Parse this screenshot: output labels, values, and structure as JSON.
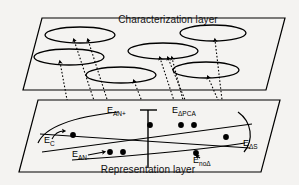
{
  "figure": {
    "name": "two-layer-mapping-diagram",
    "background_color": "#f4f3f1",
    "ink_color": "#000000"
  },
  "layers": {
    "top": {
      "title": "Characterization layer",
      "title_x": 168,
      "title_y": 23,
      "panel_points": "42,18 285,18 266,90 23,90",
      "clusters": [
        {
          "name": "cluster-1",
          "cx": 80,
          "cy": 35,
          "rx": 35,
          "ry": 8
        },
        {
          "name": "cluster-2",
          "cx": 69,
          "cy": 57,
          "rx": 35,
          "ry": 8
        },
        {
          "name": "cluster-3",
          "cx": 121,
          "cy": 75,
          "rx": 35,
          "ry": 8
        },
        {
          "name": "cluster-4",
          "cx": 163,
          "cy": 51,
          "rx": 35,
          "ry": 8
        },
        {
          "name": "cluster-5",
          "cx": 213,
          "cy": 33,
          "rx": 33,
          "ry": 8
        },
        {
          "name": "cluster-6",
          "cx": 206,
          "cy": 70,
          "rx": 33,
          "ry": 8
        }
      ]
    },
    "bottom": {
      "title": "Representation layer",
      "title_x": 148,
      "title_y": 173,
      "panel_points": "38,100 280,100 261,172 19,172"
    }
  },
  "chart_data": {
    "type": "scatter",
    "title": "Representation layer",
    "xlabel": "",
    "ylabel": "",
    "grid": false,
    "legend": "none",
    "axis": {
      "vertical_line": {
        "x": 148,
        "y_top": 110,
        "y_bottom": 168
      },
      "cap_bar": {
        "x1": 140,
        "x2": 157,
        "y": 110
      }
    },
    "point_labels": [
      {
        "id": "EC",
        "base": "E",
        "sub": "C",
        "x": 44,
        "y": 143
      },
      {
        "id": "EANp",
        "base": "E",
        "sub": "AN+",
        "x": 107,
        "y": 113
      },
      {
        "id": "EANm",
        "base": "E",
        "sub": "AN-",
        "x": 72,
        "y": 157
      },
      {
        "id": "EdPCA",
        "base": "E",
        "sub": "ΔPCA",
        "x": 172,
        "y": 113
      },
      {
        "id": "EnoD",
        "base": "E",
        "sub": "noΔ",
        "x": 193,
        "y": 163
      },
      {
        "id": "EdS",
        "base": "E",
        "sub": "ΔS",
        "x": 243,
        "y": 146
      }
    ],
    "points": [
      {
        "name": "point-EC",
        "x": 73,
        "y": 135,
        "r": 2.9,
        "group": "EC"
      },
      {
        "name": "point-EAN-minus-1",
        "x": 110,
        "y": 152,
        "r": 2.9,
        "group": "EAN-"
      },
      {
        "name": "point-EAN-minus-2",
        "x": 123,
        "y": 152,
        "r": 2.9,
        "group": "EAN-"
      },
      {
        "name": "point-EAN-plus",
        "x": 150,
        "y": 125,
        "r": 2.9,
        "group": "EAN+"
      },
      {
        "name": "point-EdPCA-1",
        "x": 181,
        "y": 125,
        "r": 2.9,
        "group": "EdPCA"
      },
      {
        "name": "point-EdPCA-2",
        "x": 194,
        "y": 125,
        "r": 2.9,
        "group": "EdPCA"
      },
      {
        "name": "point-EnoD",
        "x": 196,
        "y": 153,
        "r": 2.9,
        "group": "EnoD"
      },
      {
        "name": "point-EdS",
        "x": 226,
        "y": 137,
        "r": 2.9,
        "group": "EdS"
      }
    ],
    "cross_curves": [
      {
        "name": "curve-upper-sweep",
        "d": "M 38,143 C 45,127 72,117 118,112"
      },
      {
        "name": "curve-lower-sweep",
        "d": "M 72,160 C 120,157 200,150 245,143"
      },
      {
        "name": "curve-diag-down",
        "d": "M 40,134 L 250,148"
      },
      {
        "name": "curve-diag-up",
        "d": "M 42,152 L 252,124"
      },
      {
        "name": "curve-right-arc",
        "d": "M 238,112 C 252,122 254,140 244,152"
      }
    ],
    "leaders": [
      {
        "name": "leader-EC",
        "d": "M 52,139 C 55,133 60,131 64,131"
      },
      {
        "name": "leader-EANm",
        "d": "M 88,155 L 104,152"
      },
      {
        "name": "leader-EnoD",
        "d": "M 200,158 L 197,156"
      }
    ]
  },
  "mapping_arrows": [
    {
      "name": "arrow-EC-to-cluster2",
      "d": "M 73,132 L 60,62",
      "from": "point-EC",
      "to": "cluster-2"
    },
    {
      "name": "arrow-EANm1-to-cluster1",
      "d": "M 110,149 L 74,40",
      "from": "point-EAN-minus-1",
      "to": "cluster-1"
    },
    {
      "name": "arrow-EANm2-to-cluster1",
      "d": "M 123,149 L 88,40",
      "from": "point-EAN-minus-2",
      "to": "cluster-1"
    },
    {
      "name": "arrow-EANp-to-cluster3",
      "d": "M 150,122 L 134,81",
      "from": "point-EAN+",
      "to": "cluster-3"
    },
    {
      "name": "arrow-EdPCA1-to-cluster4",
      "d": "M 181,122 L 160,58",
      "from": "point-EdPCA-1",
      "to": "cluster-4"
    },
    {
      "name": "arrow-EdPCA2-to-cluster4",
      "d": "M 194,122 L 168,58",
      "from": "point-EdPCA-2",
      "to": "cluster-4"
    },
    {
      "name": "arrow-EnoD-to-cluster4",
      "d": "M 196,150 L 172,58",
      "from": "point-EnoD",
      "to": "cluster-4"
    },
    {
      "name": "arrow-EdS-to-cluster5",
      "d": "M 226,134 L 215,40",
      "from": "point-EdS",
      "to": "cluster-5"
    },
    {
      "name": "arrow-EdS-to-cluster6",
      "d": "M 231,130 L 208,77",
      "from": "point-EdS",
      "to": "cluster-6"
    }
  ]
}
